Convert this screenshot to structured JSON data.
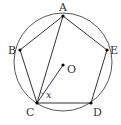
{
  "diagram": {
    "circle": {
      "cx": 63,
      "cy": 62,
      "r": 49
    },
    "points": {
      "A": {
        "label": "A",
        "x": 63,
        "y": 16
      },
      "B": {
        "label": "B",
        "x": 20,
        "y": 50
      },
      "C": {
        "label": "C",
        "x": 37,
        "y": 103
      },
      "D": {
        "label": "D",
        "x": 91,
        "y": 103
      },
      "E": {
        "label": "E",
        "x": 107,
        "y": 50
      },
      "O": {
        "label": "O",
        "x": 63,
        "y": 65
      }
    },
    "angle_label": "x",
    "colors": {
      "stroke": "#333333",
      "point": "#000000",
      "background": "#ffffff"
    }
  }
}
